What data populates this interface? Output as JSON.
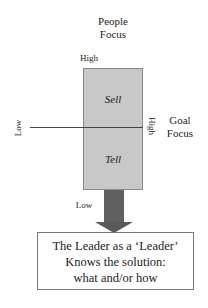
{
  "diagram": {
    "top_axis": {
      "title_line1": "People",
      "title_line2": "Focus",
      "high_label": "High",
      "low_label": "Low"
    },
    "right_axis": {
      "title_line1": "Goal",
      "title_line2": "Focus",
      "high_label": "High",
      "low_label": "Low"
    },
    "quadrants": {
      "upper": "Sell",
      "lower": "Tell"
    },
    "result_box": {
      "line1": "The Leader as a ‘Leader’",
      "line2": "Knows the solution:",
      "line3": "what and/or how"
    },
    "colors": {
      "quadrant_fill": "#c8c8c8",
      "arrow_fill": "#606060",
      "line": "#444444"
    }
  }
}
